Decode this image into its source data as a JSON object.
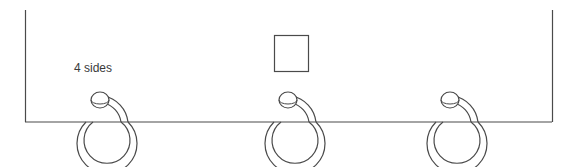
{
  "diagram": {
    "label": "4 sides",
    "stroke_color": "#4a4a4a",
    "background": "#ffffff",
    "frame": {
      "left_x": 25,
      "right_x": 552,
      "top_y": 10,
      "bottom_y": 122
    },
    "square": {
      "x": 274,
      "y": 35,
      "width": 34,
      "height": 36
    },
    "rings": [
      {
        "id": "ring-1",
        "cx": 100
      },
      {
        "id": "ring-2",
        "cx": 288
      },
      {
        "id": "ring-3",
        "cx": 450
      }
    ]
  }
}
